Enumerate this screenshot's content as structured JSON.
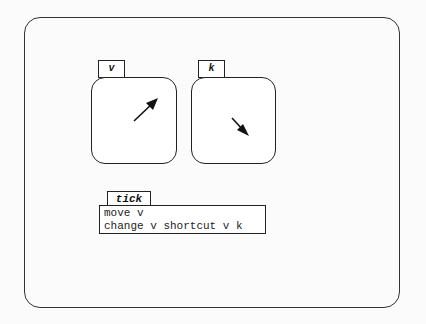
{
  "variables": [
    {
      "name": "v",
      "direction": "up-right"
    },
    {
      "name": "k",
      "direction": "down-right"
    }
  ],
  "procedure": {
    "name": "tick",
    "lines": [
      "move v",
      "change v shortcut v k"
    ]
  }
}
